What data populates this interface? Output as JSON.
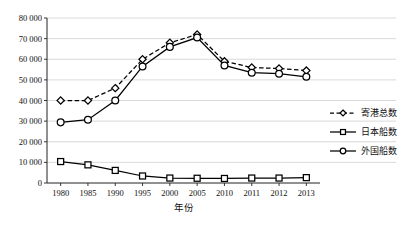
{
  "chart_data": {
    "type": "line",
    "title": "",
    "xlabel": "年份",
    "ylabel": "",
    "categories": [
      "1980",
      "1985",
      "1990",
      "1995",
      "2000",
      "2005",
      "2010",
      "2011",
      "2012",
      "2013"
    ],
    "ylim": [
      0,
      80000
    ],
    "ytick_labels": [
      "0",
      "10 000",
      "20 000",
      "30 000",
      "40 000",
      "50 000",
      "60 000",
      "70 000",
      "80 000"
    ],
    "ytick_values": [
      0,
      10000,
      20000,
      30000,
      40000,
      50000,
      60000,
      70000,
      80000
    ],
    "grid": true,
    "grid_axis": "y",
    "legend_position": "right",
    "series": [
      {
        "name": "寄港总数",
        "marker": "diamond",
        "line_style": "dashed",
        "color": "#000000",
        "values": [
          40000,
          40000,
          46000,
          60000,
          68000,
          72000,
          59000,
          56000,
          55500,
          54500
        ]
      },
      {
        "name": "日本船数",
        "marker": "square",
        "line_style": "solid",
        "color": "#000000",
        "values": [
          10400,
          8800,
          6100,
          3400,
          2400,
          2300,
          2200,
          2400,
          2400,
          2600
        ]
      },
      {
        "name": "外国船数",
        "marker": "circle",
        "line_style": "solid",
        "color": "#000000",
        "values": [
          29400,
          30700,
          40000,
          56500,
          66000,
          70500,
          57000,
          53500,
          53000,
          51500
        ]
      }
    ]
  },
  "legend": {
    "items": [
      {
        "label": "寄港总数"
      },
      {
        "label": "日本船数"
      },
      {
        "label": "外国船数"
      }
    ]
  },
  "axes": {
    "x_title": "年份"
  }
}
